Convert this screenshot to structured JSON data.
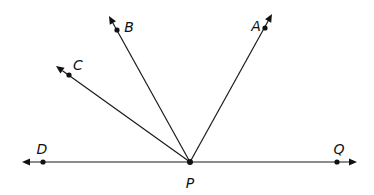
{
  "diagram": {
    "type": "geometry-rays",
    "vertex": {
      "label": "P",
      "x": 190,
      "y": 162,
      "lx": 190,
      "ly": 188
    },
    "rays": [
      {
        "name": "PA",
        "label": "A",
        "dot": [
          265,
          28
        ],
        "tip": [
          272,
          14
        ],
        "lx": 256,
        "ly": 31
      },
      {
        "name": "PB",
        "label": "B",
        "dot": [
          117,
          30
        ],
        "tip": [
          109,
          16
        ],
        "lx": 129,
        "ly": 32
      },
      {
        "name": "PC",
        "label": "C",
        "dot": [
          69,
          75
        ],
        "tip": [
          56,
          66
        ],
        "lx": 78,
        "ly": 70
      },
      {
        "name": "PD",
        "label": "D",
        "dot": [
          43,
          162
        ],
        "tip": [
          22,
          162
        ],
        "lx": 42,
        "ly": 154
      },
      {
        "name": "PQ",
        "label": "Q",
        "dot": [
          337,
          162
        ],
        "tip": [
          357,
          162
        ],
        "lx": 339,
        "ly": 154
      }
    ],
    "color": "#111111"
  }
}
